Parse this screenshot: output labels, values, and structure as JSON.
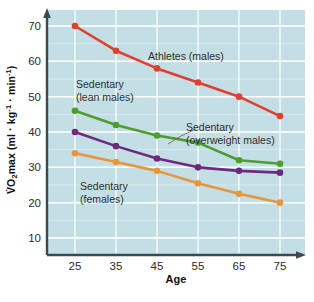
{
  "chart_data": {
    "type": "line",
    "title": "",
    "xlabel": "Age",
    "ylabel": "VO2max (ml · kg-1 · min-1)",
    "x": [
      25,
      35,
      45,
      55,
      65,
      75
    ],
    "xlim": [
      20,
      80
    ],
    "ylim": [
      0,
      74
    ],
    "xticks": [
      "25",
      "35",
      "45",
      "55",
      "65",
      "75"
    ],
    "yticks": [
      "10",
      "20",
      "30",
      "40",
      "50",
      "60",
      "70"
    ],
    "grid": "major and minor horizontal white gridlines, vertical gridlines at ticks",
    "legend": "inline annotations next to each line",
    "series": [
      {
        "name": "Athletes (males)",
        "color": "#e0402f",
        "values": [
          70,
          63,
          58,
          54,
          50,
          44.5
        ],
        "label": "Athletes (males)"
      },
      {
        "name": "Sedentary (lean males)",
        "color": "#4f9c2f",
        "values": [
          46,
          42,
          39,
          37,
          32,
          31
        ],
        "label_line1": "Sedentary",
        "label_line2": "(lean males)"
      },
      {
        "name": "Sedentary (overweight males)",
        "color": "#6d2a7e",
        "values": [
          40,
          36,
          32.5,
          30,
          29,
          28.5
        ],
        "label_line1": "Sedentary",
        "label_line2": "(overweight males)"
      },
      {
        "name": "Sedentary (females)",
        "color": "#e8963a",
        "values": [
          34,
          31.5,
          29,
          25.5,
          22.5,
          20
        ],
        "label_line1": "Sedentary",
        "label_line2": "(females)"
      }
    ],
    "colors": {
      "plot_background": "#c3dee4",
      "gridline": "#ffffff",
      "axis": "#3a4a4f",
      "page_background": "#ffffff",
      "text": "#2b2b2b"
    }
  },
  "axis": {
    "y_label_prefix": "V",
    "y_label_o": "O",
    "y_label_sub": "2",
    "y_label_max": "max",
    "y_label_units_open": " (ml ",
    "y_label_mid": " kg",
    "y_label_sup1": "-1",
    "y_label_mid2": " min",
    "y_label_sup2": "-1",
    "y_label_close": ")",
    "x_title": "Age"
  }
}
